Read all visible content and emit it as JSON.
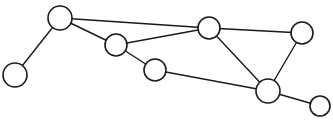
{
  "diagram": {
    "kind": "graph-diagram",
    "background_color": "#ffffff",
    "node_fill_color": "#ffffff",
    "node_stroke_color": "#1a1a1a",
    "edge_stroke_color": "#1a1a1a",
    "node_stroke_width": 1.6,
    "edge_stroke_width": 1.4,
    "node_count": 8,
    "edge_count": 10,
    "width": 333,
    "height": 124
  },
  "nodes": [
    {
      "id": "n1",
      "label": "",
      "cx": 15,
      "cy": 75,
      "r": 12,
      "position_name": "far-left"
    },
    {
      "id": "n2",
      "label": "",
      "cx": 60,
      "cy": 18,
      "r": 12,
      "position_name": "top-left"
    },
    {
      "id": "n3",
      "label": "",
      "cx": 116,
      "cy": 45,
      "r": 11,
      "position_name": "upper-middle-left"
    },
    {
      "id": "n4",
      "label": "",
      "cx": 155,
      "cy": 70,
      "r": 11,
      "position_name": "middle"
    },
    {
      "id": "n5",
      "label": "",
      "cx": 209,
      "cy": 28,
      "r": 11,
      "position_name": "top-center-right"
    },
    {
      "id": "n6",
      "label": "",
      "cx": 302,
      "cy": 33,
      "r": 11,
      "position_name": "top-right"
    },
    {
      "id": "n7",
      "label": "",
      "cx": 268,
      "cy": 91,
      "r": 12,
      "position_name": "bottom-right-hub"
    },
    {
      "id": "n8",
      "label": "",
      "cx": 320,
      "cy": 106,
      "r": 10,
      "position_name": "bottom-far-right"
    }
  ],
  "edges": [
    {
      "id": "e1",
      "source": "n1",
      "target": "n2"
    },
    {
      "id": "e2",
      "source": "n2",
      "target": "n3"
    },
    {
      "id": "e3",
      "source": "n2",
      "target": "n5"
    },
    {
      "id": "e4",
      "source": "n3",
      "target": "n5"
    },
    {
      "id": "e5",
      "source": "n3",
      "target": "n4"
    },
    {
      "id": "e6",
      "source": "n4",
      "target": "n7"
    },
    {
      "id": "e7",
      "source": "n5",
      "target": "n7"
    },
    {
      "id": "e8",
      "source": "n5",
      "target": "n6"
    },
    {
      "id": "e9",
      "source": "n6",
      "target": "n7"
    },
    {
      "id": "e10",
      "source": "n7",
      "target": "n8"
    }
  ]
}
